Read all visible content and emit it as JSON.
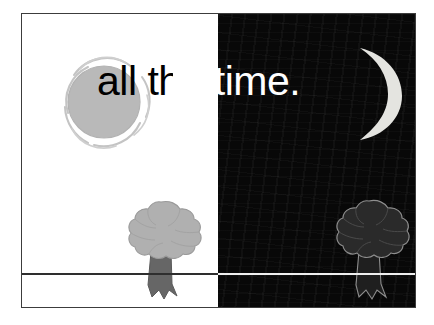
{
  "slide": {
    "headline": "all the time.",
    "background_color": "#ffffff",
    "frame_color": "#3c3c3c"
  },
  "panels": {
    "day": {
      "name": "day",
      "background_color": "#ffffff",
      "horizon_color": "#2e2e2e"
    },
    "night": {
      "name": "night",
      "background_color": "#080808",
      "horizon_color": "#efefef"
    }
  },
  "artwork": {
    "sun": {
      "label": "sun",
      "disc_color": "#b9b9b9",
      "swirl_color": "#c9c9c9"
    },
    "moon": {
      "label": "crescent moon",
      "color": "#e4e4e0"
    },
    "tree_day": {
      "label": "tree",
      "canopy_color": "#b0b0b0",
      "trunk_color": "#666666",
      "outline_color": "#8a8a8a"
    },
    "tree_night": {
      "label": "tree",
      "canopy_color": "#2a2a2a",
      "trunk_color": "#1f1f1f",
      "outline_color": "#8e8e8e"
    }
  }
}
